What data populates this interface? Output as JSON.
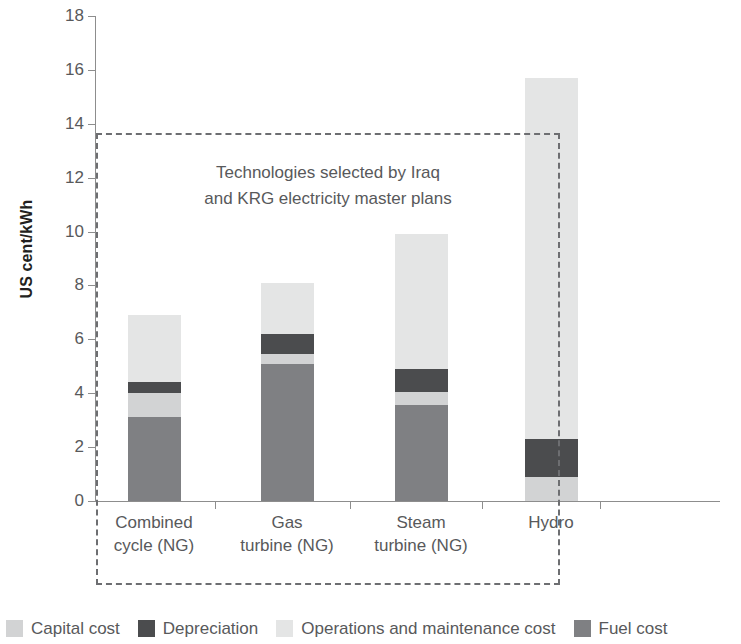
{
  "chart_data": {
    "type": "bar",
    "subtype": "stacked-bar",
    "title": "",
    "xlabel": "",
    "ylabel": "US cent/kWh",
    "ylim": [
      0,
      18
    ],
    "ytick_step": 2,
    "yticks": [
      0,
      2,
      4,
      6,
      8,
      10,
      12,
      14,
      16,
      18
    ],
    "grid": false,
    "legend_position": "bottom",
    "categories": [
      "Combined cycle (NG)",
      "Gas turbine (NG)",
      "Steam turbine (NG)",
      "Hydro"
    ],
    "series": [
      {
        "name": "Fuel cost",
        "color": "#7f8083",
        "values": [
          3.1,
          5.1,
          3.55,
          0
        ]
      },
      {
        "name": "Capital cost",
        "color": "#d2d3d4",
        "values": [
          0.9,
          0.35,
          0.5,
          0.9
        ]
      },
      {
        "name": "Depreciation",
        "color": "#4b4c4e",
        "values": [
          0.4,
          0.75,
          0.85,
          1.4
        ]
      },
      {
        "name": "Operations and maintenance cost",
        "color": "#e4e5e5",
        "values": [
          2.5,
          1.9,
          5.0,
          13.4
        ]
      }
    ],
    "totals": [
      6.9,
      8.1,
      9.9,
      15.7
    ],
    "stack_order": [
      "Fuel cost",
      "Capital cost",
      "Depreciation",
      "Operations and maintenance cost"
    ],
    "annotations": [
      {
        "text_line1": "Technologies selected by Iraq",
        "text_line2": "and KRG electricity master plans",
        "style": "dashed-box",
        "covers": [
          "Combined cycle (NG)",
          "Gas turbine (NG)",
          "Steam turbine (NG)"
        ]
      }
    ]
  },
  "axis": {
    "y_title": "US cent/kWh",
    "y_ticks": [
      "18",
      "16",
      "14",
      "12",
      "10",
      "8",
      "6",
      "4",
      "2",
      "0"
    ],
    "x_labels": [
      {
        "line1": "Combined",
        "line2": "cycle (NG)"
      },
      {
        "line1": "Gas",
        "line2": "turbine (NG)"
      },
      {
        "line1": "Steam",
        "line2": "turbine (NG)"
      },
      {
        "line1": "Hydro",
        "line2": ""
      }
    ]
  },
  "callout": {
    "line1": "Technologies selected by Iraq",
    "line2": "and KRG electricity master plans"
  },
  "legend": {
    "items": [
      {
        "label": "Capital cost",
        "color": "#d2d3d4"
      },
      {
        "label": "Depreciation",
        "color": "#4b4c4e"
      },
      {
        "label": "Operations and maintenance cost",
        "color": "#e4e5e5"
      },
      {
        "label": "Fuel cost",
        "color": "#7f8083"
      }
    ]
  },
  "colors": {
    "axis": "#8d8d8d",
    "text": "#58595b",
    "title_text": "#231f20",
    "dash": "#6d6e71",
    "background": "#ffffff"
  }
}
